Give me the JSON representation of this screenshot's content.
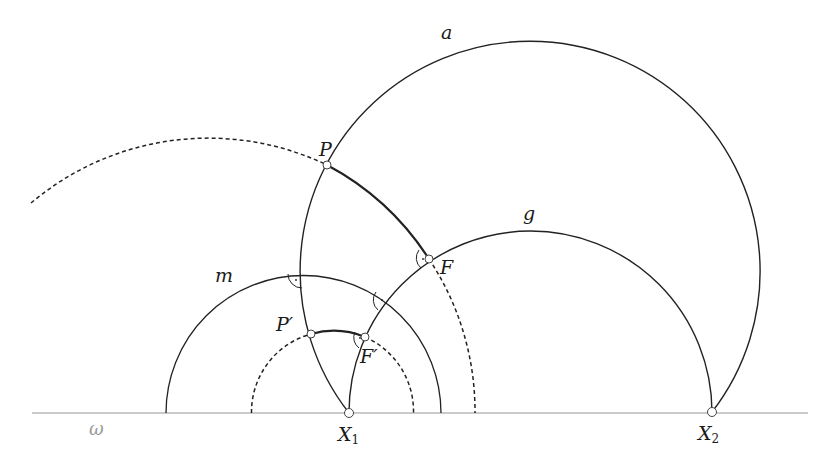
{
  "diagram": {
    "type": "hyperbolic-geometry-construction",
    "colors": {
      "line": "#222222",
      "baseline": "#b8b8b8",
      "omega_label": "#9a9a9a",
      "point_fill": "#ffffff"
    },
    "baseline": {
      "label": "ω",
      "y": 413,
      "x_from": 32,
      "x_to": 808
    },
    "points": [
      {
        "id": "P",
        "label": "P",
        "x": 327,
        "y": 165
      },
      {
        "id": "F",
        "label": "F",
        "x": 429,
        "y": 259
      },
      {
        "id": "P_prime",
        "label": "P′",
        "x": 311,
        "y": 334
      },
      {
        "id": "F_prime",
        "label": "F′",
        "x": 365,
        "y": 337
      },
      {
        "id": "X1",
        "label": "X",
        "sub": "1",
        "x": 349,
        "y": 413
      },
      {
        "id": "X2",
        "label": "X",
        "sub": "2",
        "x": 712,
        "y": 412
      }
    ],
    "curves": [
      {
        "id": "a",
        "label": "a",
        "center": [
          530,
          268
        ],
        "r": 230,
        "style": "solid"
      },
      {
        "id": "g",
        "label": "g",
        "center": [
          530.5,
          413
        ],
        "r": 181.5,
        "style": "solid"
      },
      {
        "id": "m",
        "label": "m",
        "center": [
          303.5,
          413
        ],
        "r": 137.5,
        "style": "solid"
      },
      {
        "id": "PF-circle",
        "label": "",
        "center": [
          205,
          413
        ],
        "r": 275,
        "style": "dashed-with-solid-PF-segment"
      },
      {
        "id": "PprimeFprime-circle",
        "label": "",
        "center": [
          332.5,
          413
        ],
        "r": 81,
        "style": "dashed-with-solid-P'F'-segment"
      }
    ],
    "right_angle_marks": [
      {
        "at": "a∩m",
        "x": 302,
        "y": 273
      },
      {
        "at": "g∩m",
        "x": 386,
        "y": 300
      },
      {
        "at": "F",
        "x": 429,
        "y": 259
      },
      {
        "at": "F′",
        "x": 365,
        "y": 337
      }
    ],
    "labels": {
      "a": "a",
      "g": "g",
      "m": "m",
      "P": "P",
      "F": "F",
      "P_prime": "P′",
      "F_prime": "F′",
      "X1_main": "X",
      "X1_sub": "1",
      "X2_main": "X",
      "X2_sub": "2",
      "omega": "ω"
    }
  }
}
